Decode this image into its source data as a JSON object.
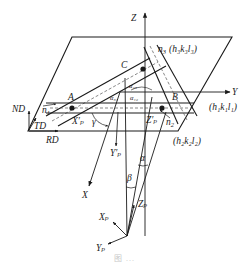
{
  "figure": {
    "type": "3D crystallographic coordinate diagram",
    "caption": "图 ...",
    "labels": {
      "Z": "Z",
      "Y": "Y",
      "X": "X",
      "ND": "ND",
      "TD": "TD",
      "RD": "RD",
      "A": "A",
      "B": "B",
      "C": "C",
      "n1": "n",
      "n1_sub": "1",
      "n2": "n",
      "n2_sub": "2",
      "n3": "n",
      "n3_sub": "3",
      "n3_plane": "(h₃k₃l₃)",
      "plane1": "(h₁k₁l₁)",
      "plane2": "(h₂k₂l₂)",
      "alpha31": "α₃₁",
      "alpha12": "α₁₂",
      "alpha23": "α₂₃",
      "gamma": "γ",
      "alpha": "α",
      "beta": "β",
      "Xp_prime": "X′ₚ",
      "Yp_prime": "Y′ₚ",
      "Zp_prime": "Z′ₚ",
      "Xp": "Xₚ",
      "Yp": "Yₚ",
      "Zp": "Zₚ"
    },
    "colors": {
      "line": "#1a1a1a",
      "dashed": "#555555",
      "background": "#ffffff"
    }
  }
}
